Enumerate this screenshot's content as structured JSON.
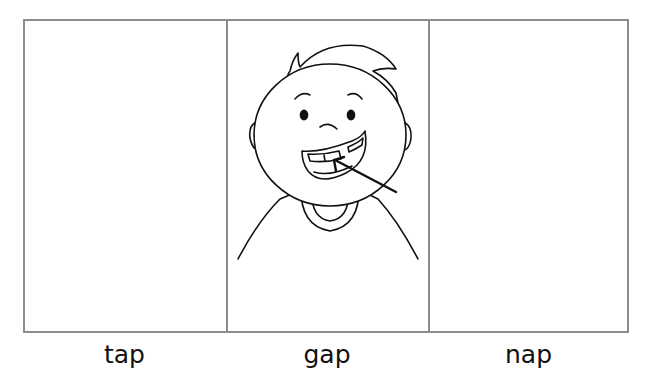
{
  "worksheet": {
    "cells": [
      {
        "word": "tap",
        "picture": "empty"
      },
      {
        "word": "gap",
        "picture": "boy-gap-tooth-icon"
      },
      {
        "word": "nap",
        "picture": "empty"
      }
    ],
    "border_color": "#8c8c8c",
    "ink_color": "#111111"
  }
}
